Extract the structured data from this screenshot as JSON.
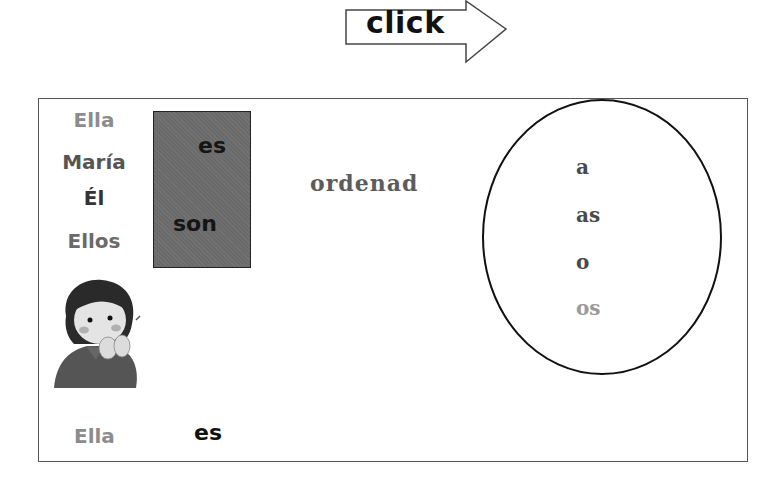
{
  "nav": {
    "click_label": "click",
    "arrow_icon": "right-arrow-outline"
  },
  "subjects": [
    {
      "label": "Ella",
      "color": "#8c8c8c"
    },
    {
      "label": "María",
      "color": "#555555"
    },
    {
      "label": "Él",
      "color": "#333333"
    },
    {
      "label": "Ellos",
      "color": "#6a6a6a"
    }
  ],
  "verbs": {
    "box_color": "#6a6a6a",
    "items": [
      {
        "label": "es"
      },
      {
        "label": "son"
      }
    ]
  },
  "instruction": {
    "label": "ordenad",
    "color": "#5c5c5c"
  },
  "endings": {
    "items": [
      {
        "label": "a",
        "color": "#4a4a4a"
      },
      {
        "label": "as",
        "color": "#4a4a4a"
      },
      {
        "label": "o",
        "color": "#4a4a4a"
      },
      {
        "label": "os",
        "color": "#9a9a9a"
      }
    ]
  },
  "illustration": {
    "name": "girl-whispering",
    "description": "girl covering mouth with hands"
  },
  "answer": {
    "subject": "Ella",
    "subject_color": "#8c8c8c",
    "verb": "es"
  }
}
